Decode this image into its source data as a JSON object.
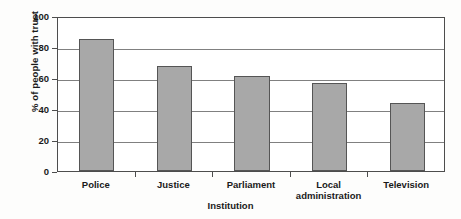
{
  "chart_data": {
    "type": "bar",
    "title": "",
    "xlabel": "Institution",
    "ylabel": "% of people with trust",
    "categories": [
      "Police",
      "Justice",
      "Parliament",
      "Local\nadministration",
      "Television"
    ],
    "values": [
      85,
      68,
      61,
      57,
      44
    ],
    "ylim": [
      0,
      100
    ],
    "yticks": [
      0,
      20,
      40,
      60,
      80,
      100
    ],
    "ytick_labels": [
      "0",
      "20",
      "40",
      "60",
      "80",
      "100"
    ],
    "grid": true,
    "grid_axis": "y",
    "legend": false,
    "bar_color": "#a8a8a8",
    "bar_edge_color": "#555555",
    "axis_color": "#4d4d4d",
    "gridline_color": "#808080",
    "background": "#ffffff"
  },
  "axes": {
    "y_title": "% of people with trust",
    "x_title": "Institution"
  },
  "x_labels": [
    {
      "line1": "Police",
      "line2": ""
    },
    {
      "line1": "Justice",
      "line2": ""
    },
    {
      "line1": "Parliament",
      "line2": ""
    },
    {
      "line1": "Local",
      "line2": "administration"
    },
    {
      "line1": "Television",
      "line2": ""
    }
  ],
  "y_labels": [
    "100",
    "80",
    "60",
    "40",
    "20",
    "0"
  ]
}
